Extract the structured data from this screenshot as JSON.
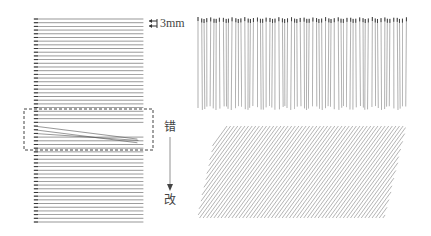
{
  "figure": {
    "horizontal_practice": {
      "spacing_label": "3mm",
      "line_count": 56,
      "error_label": "错",
      "correction_label": "改",
      "line_color": "#555555",
      "dash_color": "#444444"
    },
    "vertical_practice": {
      "line_count": 68,
      "line_color": "#666666"
    },
    "diagonal_practice": {
      "line_count": 70,
      "line_color": "#7a7a7a"
    }
  }
}
